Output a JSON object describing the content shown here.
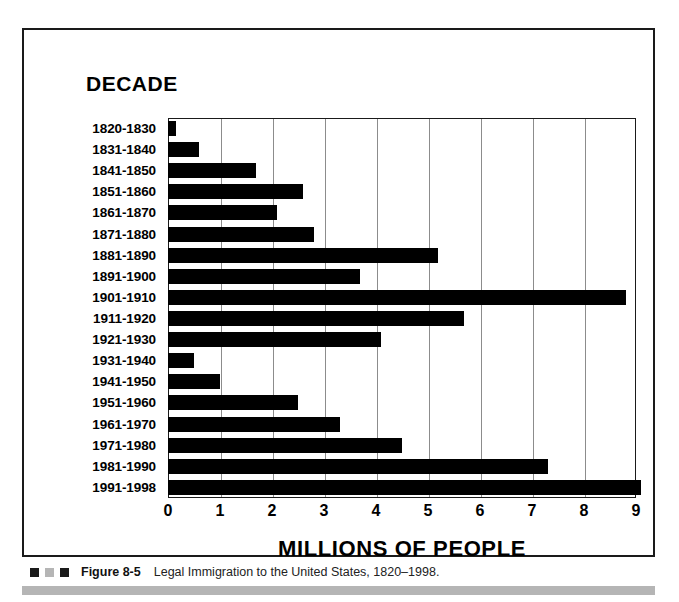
{
  "figure": {
    "heading": "DECADE",
    "caption_number": "Figure 8-5",
    "caption_text": "Legal Immigration to the United States, 1820–1998.",
    "marker_colors": [
      "#1a1a1a",
      "#b5b5b5",
      "#1a1a1a"
    ]
  },
  "chart_data": {
    "type": "bar",
    "orientation": "horizontal",
    "title": "Legal Immigration to the United States, 1820–1998",
    "xlabel": "MILLIONS OF PEOPLE",
    "ylabel": "DECADE",
    "xlim": [
      0,
      9
    ],
    "xticks": [
      "0",
      "1",
      "2",
      "3",
      "4",
      "5",
      "6",
      "7",
      "8",
      "9"
    ],
    "grid": "vertical",
    "legend": "none",
    "bar_color": "#000000",
    "categories": [
      "1820-1830",
      "1831-1840",
      "1841-1850",
      "1851-1860",
      "1861-1870",
      "1871-1880",
      "1881-1890",
      "1891-1900",
      "1901-1910",
      "1911-1920",
      "1921-1930",
      "1931-1940",
      "1941-1950",
      "1951-1960",
      "1961-1970",
      "1971-1980",
      "1981-1990",
      "1991-1998"
    ],
    "values": [
      0.15,
      0.6,
      1.7,
      2.6,
      2.1,
      2.8,
      5.2,
      3.7,
      8.8,
      5.7,
      4.1,
      0.5,
      1.0,
      2.5,
      3.3,
      4.5,
      7.3,
      9.1
    ],
    "units": "millions of people"
  }
}
